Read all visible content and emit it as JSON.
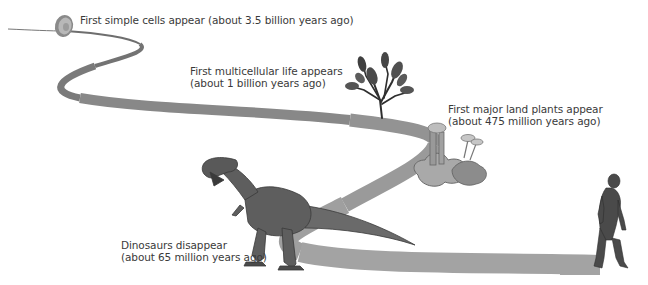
{
  "diagram": {
    "type": "timeline-path",
    "title": "",
    "path_color": "#9a9a9a",
    "milestones": [
      {
        "id": "simple-cells",
        "line1": "First simple cells appear (about 3.5 billion years ago)",
        "line2": "",
        "icon": "cell-icon"
      },
      {
        "id": "multicellular-life",
        "line1": "First multicellular life appears",
        "line2": "(about 1 billion years ago)",
        "icon": "seaweed-icon"
      },
      {
        "id": "land-plants",
        "line1": "First major land plants appear",
        "line2": "(about 475 million years ago)",
        "icon": "land-plant-icon"
      },
      {
        "id": "dinosaurs",
        "line1": "Dinosaurs disappear",
        "line2": "(about 65 million years ago)",
        "icon": "dinosaur-icon"
      },
      {
        "id": "humans",
        "line1": "",
        "line2": "",
        "icon": "early-human-icon"
      }
    ]
  }
}
